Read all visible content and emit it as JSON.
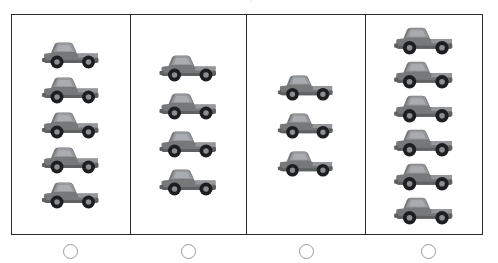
{
  "page": {
    "clipped_title": "How many trucks?",
    "background_color": "#ffffff"
  },
  "colors": {
    "frame_border": "#2b2b2b",
    "divider": "#2b2b2b",
    "truck_body": "#77787a",
    "truck_body_dark": "#5e6062",
    "truck_body_light": "#95979a",
    "truck_window": "#a9acb0",
    "truck_tire": "#1d1e20",
    "truck_rim": "#8b8d90",
    "bubble_border": "#9a9a9a",
    "bubble_fill": "#ffffff"
  },
  "icon_names": {
    "truck": "pickup-truck-icon",
    "bubble": "answer-bubble-icon"
  },
  "chart_data": {
    "type": "bar",
    "title": "How many trucks?",
    "xlabel": "",
    "ylabel": "Number of trucks",
    "categories": [
      "Group 1",
      "Group 2",
      "Group 3",
      "Group 4"
    ],
    "values": [
      5,
      4,
      3,
      6
    ],
    "unit": "pickup truck",
    "orientation": "vertical-stack-pictograph",
    "grid": false,
    "legend": null,
    "ylim": [
      0,
      6
    ]
  },
  "panels": [
    {
      "id": "panel-1",
      "label": "Group 1",
      "truck_count": 5,
      "option_label": ""
    },
    {
      "id": "panel-2",
      "label": "Group 2",
      "truck_count": 4,
      "option_label": ""
    },
    {
      "id": "panel-3",
      "label": "Group 3",
      "truck_count": 3,
      "option_label": ""
    },
    {
      "id": "panel-4",
      "label": "Group 4",
      "truck_count": 6,
      "option_label": ""
    }
  ],
  "options": [
    {
      "name": "option-a",
      "selected": false
    },
    {
      "name": "option-b",
      "selected": false
    },
    {
      "name": "option-c",
      "selected": false
    },
    {
      "name": "option-d",
      "selected": false
    }
  ]
}
